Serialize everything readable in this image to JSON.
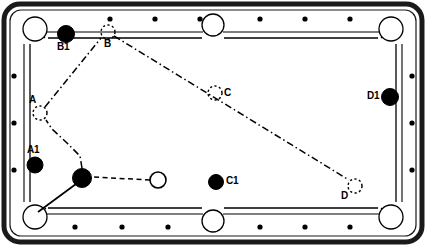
{
  "diagram": {
    "type": "billiards-table-layout",
    "table": {
      "frame_color": "#1a1a1a",
      "rail_color": "#ffffff",
      "cloth_color": "#ffffff",
      "line_color": "#000000",
      "outer": {
        "x": 4,
        "y": 4,
        "w": 418,
        "h": 238,
        "radius": 16
      },
      "inner_bed": {
        "x": 30,
        "y": 30,
        "w": 366,
        "h": 186
      },
      "diamonds_top": 6,
      "diamonds_bottom": 6,
      "diamonds_left": 3,
      "diamonds_right": 3,
      "pockets": [
        {
          "name": "top-left-pocket",
          "cx": 35,
          "cy": 29,
          "r": 12
        },
        {
          "name": "top-middle-pocket",
          "cx": 213,
          "cy": 24,
          "r": 11
        },
        {
          "name": "top-right-pocket",
          "cx": 391,
          "cy": 29,
          "r": 12
        },
        {
          "name": "bottom-left-pocket",
          "cx": 35,
          "cy": 217,
          "r": 12
        },
        {
          "name": "bottom-middle-pocket",
          "cx": 213,
          "cy": 222,
          "r": 11
        },
        {
          "name": "bottom-right-pocket",
          "cx": 391,
          "cy": 217,
          "r": 12
        }
      ]
    },
    "balls": [
      {
        "id": "cue",
        "label": "",
        "kind": "cue-ball",
        "cx": 158,
        "cy": 180,
        "r": 8,
        "fill": "#ffffff",
        "stroke": "#000000"
      },
      {
        "id": "obj",
        "label": "",
        "kind": "object-ball",
        "cx": 82,
        "cy": 178,
        "r": 9.5,
        "fill": "#000000",
        "stroke": "#000000"
      },
      {
        "id": "A1",
        "label": "A1",
        "kind": "object-ball",
        "cx": 35,
        "cy": 165,
        "r": 8,
        "fill": "#000000",
        "stroke": "#000000",
        "label_x": 27,
        "label_y": 146
      },
      {
        "id": "B1",
        "label": "B1",
        "kind": "object-ball",
        "cx": 66,
        "cy": 34,
        "r": 8.5,
        "fill": "#000000",
        "stroke": "#000000",
        "label_x": 57,
        "label_y": 44
      },
      {
        "id": "C1",
        "label": "C1",
        "kind": "object-ball",
        "cx": 216,
        "cy": 182,
        "r": 7.5,
        "fill": "#000000",
        "stroke": "#000000",
        "label_x": 226,
        "label_y": 177
      },
      {
        "id": "D1",
        "label": "D1",
        "kind": "object-ball",
        "cx": 390,
        "cy": 97,
        "r": 8.5,
        "fill": "#000000",
        "stroke": "#000000",
        "label_x": 368,
        "label_y": 92
      }
    ],
    "targets": [
      {
        "id": "A",
        "label": "A",
        "cx": 40,
        "cy": 113,
        "r": 7,
        "label_x": 29,
        "label_y": 96
      },
      {
        "id": "B",
        "label": "B",
        "cx": 108,
        "cy": 32,
        "r": 7,
        "label_x": 104,
        "label_y": 40
      },
      {
        "id": "C",
        "label": "C",
        "cx": 215,
        "cy": 93,
        "r": 7,
        "label_x": 224,
        "label_y": 89
      },
      {
        "id": "D",
        "label": "D",
        "cx": 355,
        "cy": 186,
        "r": 7,
        "label_x": 342,
        "label_y": 192
      }
    ],
    "paths": [
      {
        "id": "cue-to-object",
        "style": "dashed",
        "points": "150,180 92,177"
      },
      {
        "id": "object-to-pocket",
        "style": "solid",
        "points": "76,184 38,213"
      },
      {
        "id": "object-to-A",
        "style": "dash-dot",
        "points": "82,168 80,156 67,143 52,129 46,120"
      },
      {
        "id": "A-to-B",
        "style": "dash-dot",
        "points": "45,107 101,38"
      },
      {
        "id": "B-to-D",
        "style": "dash-dot",
        "points": "114,36 349,180"
      }
    ]
  }
}
